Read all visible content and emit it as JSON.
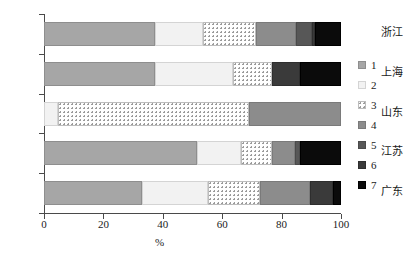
{
  "chart_data": {
    "type": "bar",
    "orientation": "horizontal",
    "stacked": true,
    "title": "",
    "xlabel": "%",
    "ylabel": "",
    "xlim": [
      0,
      100
    ],
    "xticks": [
      0,
      20,
      40,
      60,
      80,
      100
    ],
    "grid": false,
    "legend_position": "right",
    "legend_entries": [
      "1",
      "2",
      "3",
      "4",
      "5",
      "6",
      "7"
    ],
    "categories": [
      "浙江",
      "上海",
      "山东",
      "江苏",
      "广东"
    ],
    "series": [
      {
        "name": "1",
        "values": [
          37.4,
          37.4,
          0.0,
          51.5,
          33.0
        ]
      },
      {
        "name": "2",
        "values": [
          16.1,
          26.2,
          4.7,
          14.8,
          22.2
        ]
      },
      {
        "name": "3",
        "values": [
          17.9,
          13.2,
          64.3,
          10.5,
          17.5
        ]
      },
      {
        "name": "4",
        "values": [
          13.4,
          0.0,
          31.0,
          7.7,
          16.8
        ]
      },
      {
        "name": "5",
        "values": [
          5.4,
          0.0,
          0.0,
          1.7,
          0.0
        ]
      },
      {
        "name": "6",
        "values": [
          1.0,
          9.4,
          0.0,
          0.0,
          7.7
        ]
      },
      {
        "name": "7",
        "values": [
          8.8,
          13.8,
          0.0,
          13.8,
          2.8
        ]
      }
    ],
    "colors": [
      "#a6a6a6",
      "#f2f2f2",
      "#ffffff",
      "#8c8c8c",
      "#575757",
      "#3a3a3a",
      "#0b0b0b"
    ]
  },
  "axis": {
    "x_tick_labels": [
      "0",
      "20",
      "40",
      "60",
      "80",
      "100"
    ],
    "x_axis_title": "%"
  },
  "legend": {
    "items": [
      {
        "label": "1"
      },
      {
        "label": "2"
      },
      {
        "label": "3"
      },
      {
        "label": "4"
      },
      {
        "label": "5"
      },
      {
        "label": "6"
      },
      {
        "label": "7"
      }
    ]
  }
}
